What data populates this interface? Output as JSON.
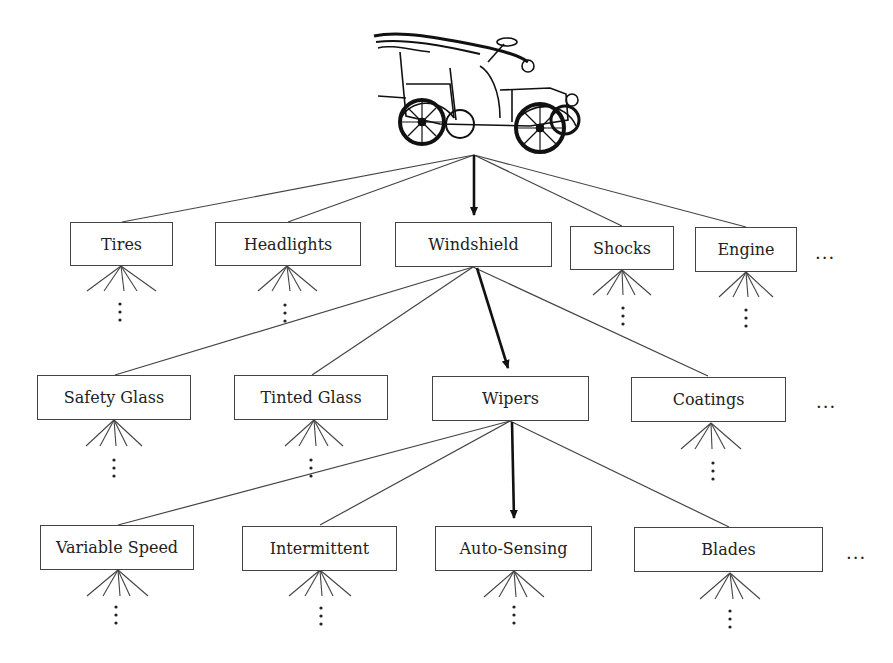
{
  "diagram": {
    "type": "hierarchy-tree",
    "root": {
      "name": "car",
      "icon": "antique-car-illustration"
    },
    "levels": [
      {
        "level": 1,
        "parent": "car",
        "highlighted": "Windshield",
        "nodes": [
          {
            "label": "Tires"
          },
          {
            "label": "Headlights"
          },
          {
            "label": "Windshield"
          },
          {
            "label": "Shocks"
          },
          {
            "label": "Engine"
          }
        ],
        "more": "..."
      },
      {
        "level": 2,
        "parent": "Windshield",
        "highlighted": "Wipers",
        "nodes": [
          {
            "label": "Safety Glass"
          },
          {
            "label": "Tinted Glass"
          },
          {
            "label": "Wipers"
          },
          {
            "label": "Coatings"
          }
        ],
        "more": "..."
      },
      {
        "level": 3,
        "parent": "Wipers",
        "highlighted": "Auto-Sensing",
        "nodes": [
          {
            "label": "Variable Speed"
          },
          {
            "label": "Intermittent"
          },
          {
            "label": "Auto-Sensing"
          },
          {
            "label": "Blades"
          }
        ],
        "more": "..."
      }
    ],
    "child_continuation": "⋮",
    "colors": {
      "line": "#444444",
      "highlight_arrow": "#111111",
      "box_border": "#444444",
      "text": "#222222"
    }
  }
}
